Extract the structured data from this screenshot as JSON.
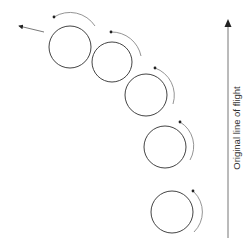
{
  "diagram": {
    "label": "Original line of flight",
    "colors": {
      "circle_stroke": "#444444",
      "arc_stroke": "#888888",
      "arrow": "#222222",
      "text": "#333333"
    },
    "balls": [
      {
        "cx": 70,
        "cy": 47,
        "r": 21
      },
      {
        "cx": 112,
        "cy": 62,
        "r": 20
      },
      {
        "cx": 146,
        "cy": 95,
        "r": 21
      },
      {
        "cx": 165,
        "cy": 147,
        "r": 21
      },
      {
        "cx": 172,
        "cy": 212,
        "r": 21
      }
    ],
    "spin_direction": "counterclockwise",
    "trajectory_arrow": {
      "from": [
        44,
        32
      ],
      "to": [
        16,
        25
      ]
    },
    "flight_axis": {
      "x": 228,
      "y_start": 238,
      "y_end": 20
    }
  }
}
